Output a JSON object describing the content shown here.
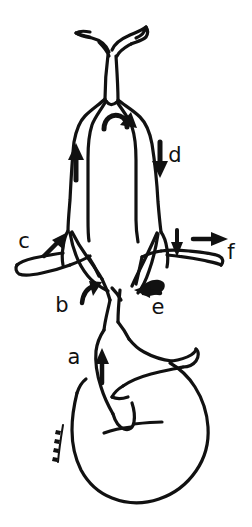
{
  "figure": {
    "type": "line-drawing",
    "background_color": "#ffffff",
    "ink_color": "#111111",
    "width": 252,
    "height": 527,
    "signature_mark": "illegible handwritten signature"
  },
  "labels": [
    {
      "id": "a",
      "text": "a",
      "x": 74,
      "y": 364,
      "arrow": "arrow-up",
      "arrow_x": 101,
      "arrow_y": 358
    },
    {
      "id": "b",
      "text": "b",
      "x": 62,
      "y": 312,
      "arrow": "arrow-up-right-curved",
      "arrow_x": 88,
      "arrow_y": 285
    },
    {
      "id": "c",
      "text": "c",
      "x": 24,
      "y": 248,
      "arrow": "arrow-up-right",
      "arrow_x": 53,
      "arrow_y": 240
    },
    {
      "id": "d",
      "text": "d",
      "x": 175,
      "y": 162,
      "arrow": "arrow-down",
      "arrow_x": 160,
      "arrow_y": 150
    },
    {
      "id": "e",
      "text": "e",
      "x": 158,
      "y": 314,
      "arrow": "arrow-left",
      "arrow_x": 142,
      "arrow_y": 292
    },
    {
      "id": "f",
      "text": "f",
      "x": 231,
      "y": 259,
      "arrow": "arrow-right",
      "arrow_x": 196,
      "arrow_y": 236
    }
  ],
  "flow_arrows": [
    {
      "name": "arrow-ascending-left",
      "direction": "up",
      "x": 75,
      "y": 160
    },
    {
      "name": "arrow-arch-curved",
      "direction": "curve",
      "x": 115,
      "y": 115
    },
    {
      "name": "arrow-descending-right",
      "direction": "down",
      "x": 160,
      "y": 150
    },
    {
      "name": "arrow-branch-right-down",
      "direction": "down",
      "x": 177,
      "y": 238
    }
  ]
}
